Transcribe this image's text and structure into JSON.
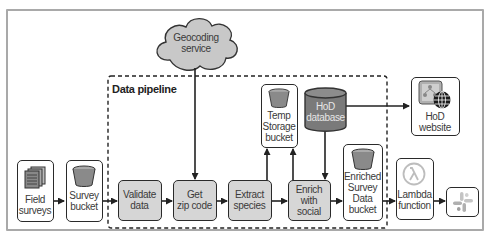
{
  "diagram": {
    "group": {
      "label": "Data pipeline"
    },
    "nodes": {
      "geocoding": {
        "label_line1": "Geocoding",
        "label_line2": "service",
        "shape": "cloud"
      },
      "field_surveys": {
        "label_line1": "Field",
        "label_line2": "surveys",
        "icon": "documents-icon"
      },
      "survey_bucket": {
        "label_line1": "Survey",
        "label_line2": "bucket",
        "icon": "bucket-icon"
      },
      "validate": {
        "label_line1": "Validate",
        "label_line2": "data"
      },
      "zip": {
        "label_line1": "Get",
        "label_line2": "zip code"
      },
      "extract": {
        "label_line1": "Extract",
        "label_line2": "species"
      },
      "enrich": {
        "label_line1": "Enrich",
        "label_line2": "with",
        "label_line3": "social"
      },
      "temp_storage": {
        "label_line1": "Temp",
        "label_line2": "Storage",
        "label_line3": "bucket",
        "icon": "bucket-icon"
      },
      "hod_db": {
        "label_line1": "HoD",
        "label_line2": "database",
        "shape": "cylinder"
      },
      "enriched_bucket": {
        "label_line1": "Enriched",
        "label_line2": "Survey",
        "label_line3": "Data",
        "label_line4": "bucket",
        "icon": "bucket-icon"
      },
      "hod_website": {
        "label_line1": "HoD",
        "label_line2": "website",
        "icon": "website-globe-icon"
      },
      "lambda": {
        "label_line1": "Lambda",
        "label_line2": "function",
        "icon": "lambda-icon"
      },
      "slack": {
        "icon": "slack-icon"
      }
    },
    "edges": [
      {
        "from": "Field surveys",
        "to": "Survey bucket"
      },
      {
        "from": "Survey bucket",
        "to": "Validate data"
      },
      {
        "from": "Validate data",
        "to": "Get zip code"
      },
      {
        "from": "Geocoding service",
        "to": "Get zip code"
      },
      {
        "from": "Get zip code",
        "to": "Extract species"
      },
      {
        "from": "Extract species",
        "to": "Enrich with social"
      },
      {
        "from": "Extract species",
        "to": "Temp Storage bucket"
      },
      {
        "from": "Enrich with social",
        "to": "Temp Storage bucket"
      },
      {
        "from": "HoD database",
        "to": "Enrich with social"
      },
      {
        "from": "HoD database",
        "to": "HoD website"
      },
      {
        "from": "Enrich with social",
        "to": "Enriched Survey Data bucket"
      },
      {
        "from": "Enriched Survey Data bucket",
        "to": "Lambda function"
      },
      {
        "from": "Lambda function",
        "to": "Slack"
      }
    ],
    "colors": {
      "process_fill": "#d6d6d6",
      "bucket_fill": "#8a8a8a",
      "database_fill": "#7a7a7a",
      "cloud_fill": "#c8c8c8",
      "border": "#2a2a2a"
    }
  }
}
